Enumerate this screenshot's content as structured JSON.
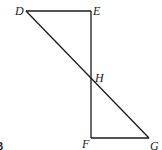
{
  "diagram": {
    "type": "geometry",
    "points": {
      "D": {
        "label": "D",
        "x": 26,
        "y": 11
      },
      "E": {
        "label": "E",
        "x": 91,
        "y": 11
      },
      "H": {
        "label": "H",
        "x": 91,
        "y": 78
      },
      "F": {
        "label": "F",
        "x": 91,
        "y": 138
      },
      "G": {
        "label": "G",
        "x": 149,
        "y": 138
      }
    },
    "segments": [
      {
        "from": "D",
        "to": "E"
      },
      {
        "from": "E",
        "to": "F"
      },
      {
        "from": "F",
        "to": "G"
      },
      {
        "from": "D",
        "to": "G"
      }
    ],
    "labels": {
      "D": "D",
      "E": "E",
      "H": "H",
      "F": "F",
      "G": "G"
    },
    "figure_label": "B"
  }
}
